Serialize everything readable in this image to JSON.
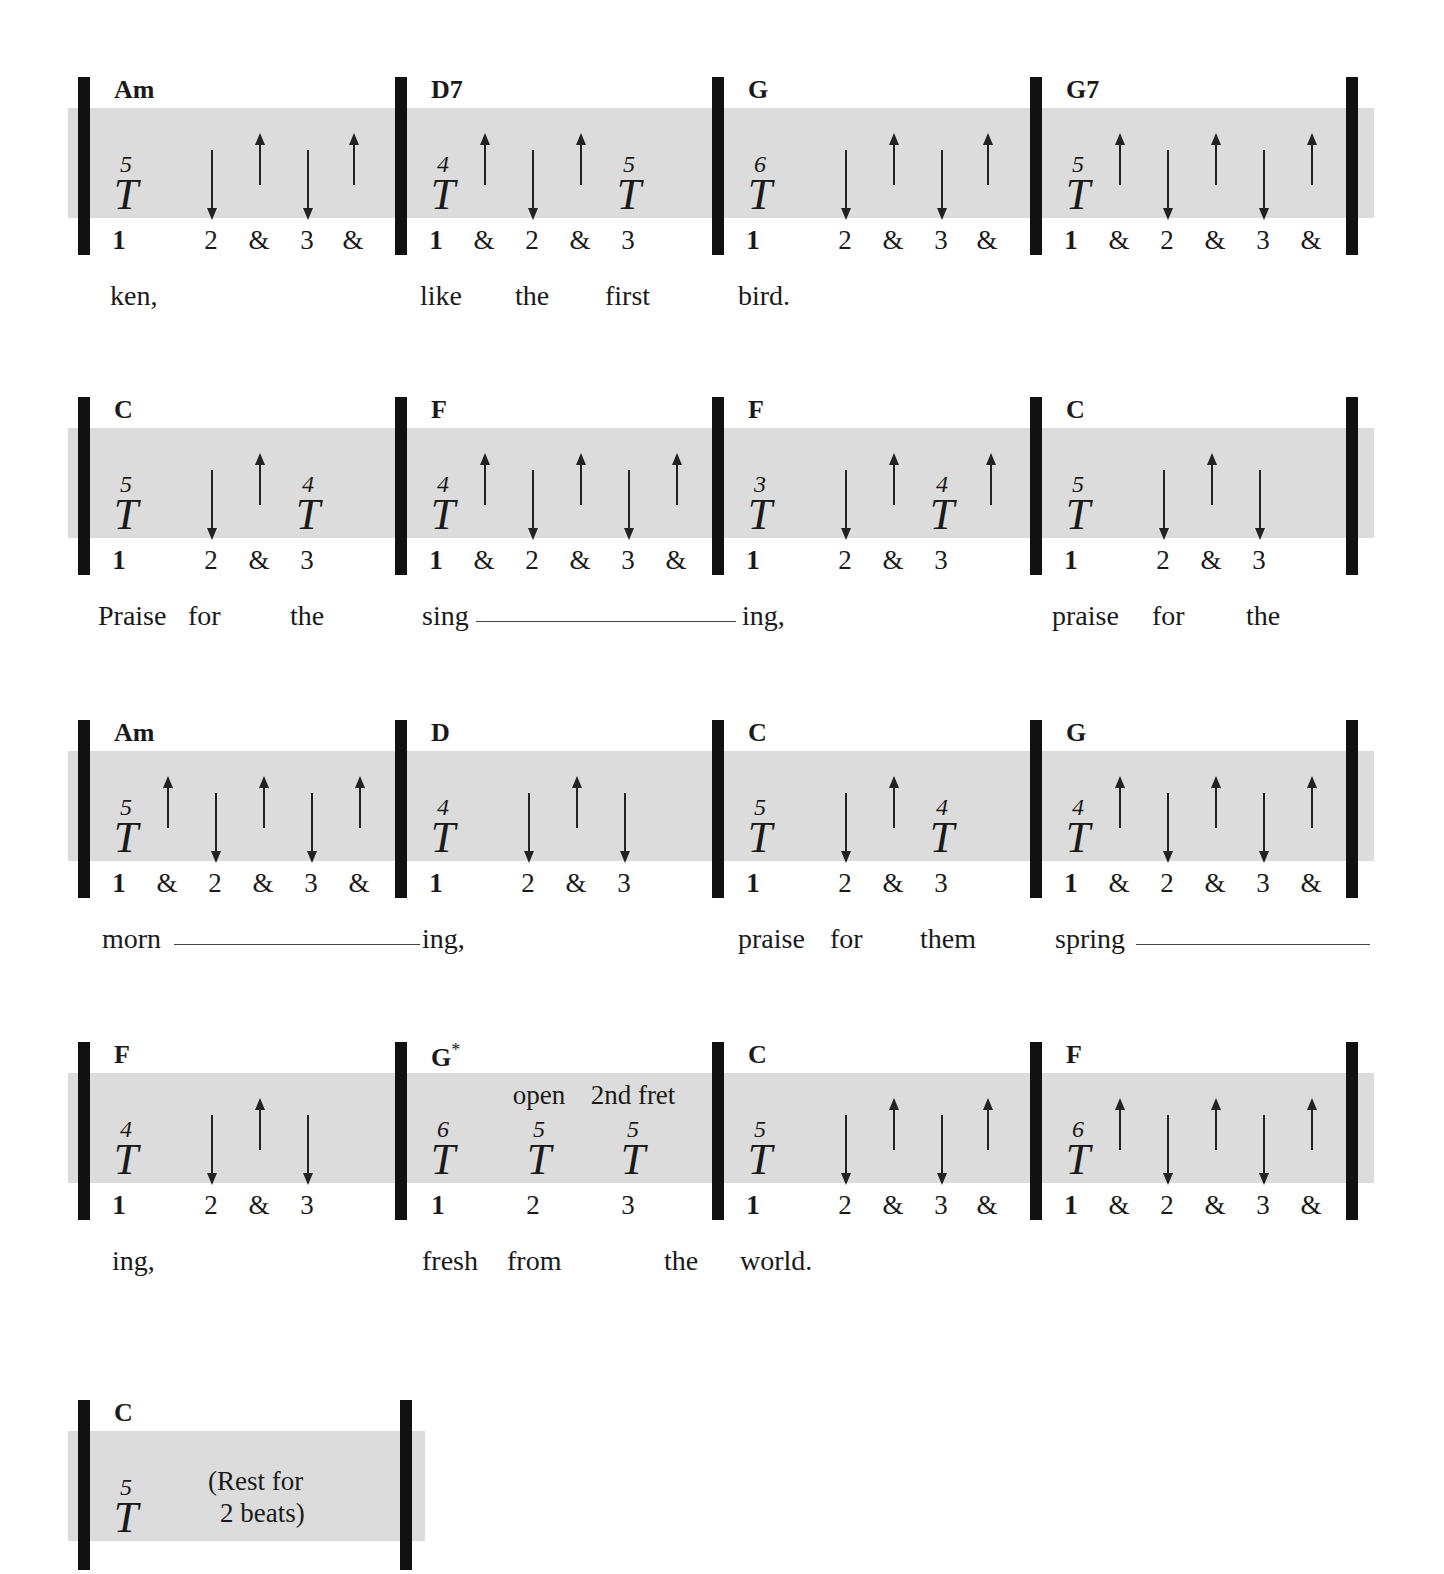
{
  "systems": [
    {
      "measures": [
        {
          "chord": "Am",
          "count": [
            "1",
            "2",
            "&",
            "3",
            "&"
          ],
          "tabs": [
            {
              "string": "5",
              "beat": "1"
            }
          ],
          "strums": [
            "down@2",
            "up@&",
            "down@3",
            "up@&"
          ]
        },
        {
          "chord": "D7",
          "count": [
            "1",
            "&",
            "2",
            "&",
            "3"
          ],
          "tabs": [
            {
              "string": "4",
              "beat": "1"
            },
            {
              "string": "5",
              "beat": "3"
            }
          ],
          "strums": [
            "up@&",
            "down@2",
            "up@&"
          ]
        },
        {
          "chord": "G",
          "count": [
            "1",
            "2",
            "&",
            "3",
            "&"
          ],
          "tabs": [
            {
              "string": "6",
              "beat": "1"
            }
          ],
          "strums": [
            "down@2",
            "up@&",
            "down@3",
            "up@&"
          ]
        },
        {
          "chord": "G7",
          "count": [
            "1",
            "&",
            "2",
            "&",
            "3",
            "&"
          ],
          "tabs": [
            {
              "string": "5",
              "beat": "1"
            }
          ],
          "strums": [
            "up@&",
            "down@2",
            "up@&",
            "down@3",
            "up@&"
          ]
        }
      ],
      "lyrics": [
        "ken,",
        "like",
        "the",
        "first",
        "bird."
      ]
    },
    {
      "measures": [
        {
          "chord": "C",
          "count": [
            "1",
            "2",
            "&",
            "3"
          ],
          "tabs": [
            {
              "string": "5",
              "beat": "1"
            },
            {
              "string": "4",
              "beat": "3"
            }
          ],
          "strums": [
            "down@2",
            "up@&"
          ]
        },
        {
          "chord": "F",
          "count": [
            "1",
            "&",
            "2",
            "&",
            "3",
            "&"
          ],
          "tabs": [
            {
              "string": "4",
              "beat": "1"
            }
          ],
          "strums": [
            "up@&",
            "down@2",
            "up@&",
            "down@3",
            "up@&"
          ]
        },
        {
          "chord": "F",
          "count": [
            "1",
            "2",
            "&",
            "3"
          ],
          "tabs": [
            {
              "string": "3",
              "beat": "1"
            },
            {
              "string": "4",
              "beat": "3"
            }
          ],
          "strums": [
            "down@2",
            "up@&",
            "up@after3"
          ]
        },
        {
          "chord": "C",
          "count": [
            "1",
            "2",
            "&",
            "3"
          ],
          "tabs": [
            {
              "string": "5",
              "beat": "1"
            }
          ],
          "strums": [
            "down@2",
            "up@&",
            "down@3"
          ]
        }
      ],
      "lyrics": [
        "Praise",
        "for",
        "the",
        "sing",
        "ing,",
        "praise",
        "for",
        "the"
      ]
    },
    {
      "measures": [
        {
          "chord": "Am",
          "count": [
            "1",
            "&",
            "2",
            "&",
            "3",
            "&"
          ],
          "tabs": [
            {
              "string": "5",
              "beat": "1"
            }
          ],
          "strums": [
            "up@&",
            "down@2",
            "up@&",
            "down@3",
            "up@&"
          ]
        },
        {
          "chord": "D",
          "count": [
            "1",
            "2",
            "&",
            "3"
          ],
          "tabs": [
            {
              "string": "4",
              "beat": "1"
            }
          ],
          "strums": [
            "down@2",
            "up@&",
            "down@3"
          ]
        },
        {
          "chord": "C",
          "count": [
            "1",
            "2",
            "&",
            "3"
          ],
          "tabs": [
            {
              "string": "5",
              "beat": "1"
            },
            {
              "string": "4",
              "beat": "3"
            }
          ],
          "strums": [
            "down@2",
            "up@&"
          ]
        },
        {
          "chord": "G",
          "count": [
            "1",
            "&",
            "2",
            "&",
            "3",
            "&"
          ],
          "tabs": [
            {
              "string": "4",
              "beat": "1"
            }
          ],
          "strums": [
            "up@&",
            "down@2",
            "up@&",
            "down@3",
            "up@&"
          ]
        }
      ],
      "lyrics": [
        "morn",
        "ing,",
        "praise",
        "for",
        "them",
        "spring"
      ]
    },
    {
      "measures": [
        {
          "chord": "F",
          "count": [
            "1",
            "2",
            "&",
            "3"
          ],
          "tabs": [
            {
              "string": "4",
              "beat": "1"
            }
          ],
          "strums": [
            "down@2",
            "up@&",
            "down@3"
          ]
        },
        {
          "chord": "G",
          "chord_mark": "*",
          "count": [
            "1",
            "2",
            "3"
          ],
          "tabs": [
            {
              "string": "6",
              "beat": "1"
            },
            {
              "string": "5",
              "beat": "2",
              "note": "open"
            },
            {
              "string": "5",
              "beat": "3",
              "note": "2nd fret"
            }
          ],
          "strums": []
        },
        {
          "chord": "C",
          "count": [
            "1",
            "2",
            "&",
            "3",
            "&"
          ],
          "tabs": [
            {
              "string": "5",
              "beat": "1"
            }
          ],
          "strums": [
            "down@2",
            "up@&",
            "down@3",
            "up@&"
          ]
        },
        {
          "chord": "F",
          "count": [
            "1",
            "&",
            "2",
            "&",
            "3",
            "&"
          ],
          "tabs": [
            {
              "string": "6",
              "beat": "1"
            }
          ],
          "strums": [
            "up@&",
            "down@2",
            "up@&",
            "down@3",
            "up@&"
          ]
        }
      ],
      "lyrics": [
        "ing,",
        "fresh",
        "from",
        "the",
        "world."
      ]
    },
    {
      "measures": [
        {
          "chord": "C",
          "count": [],
          "tabs": [
            {
              "string": "5",
              "beat": "1"
            }
          ],
          "rest_text_1": "(Rest for",
          "rest_text_2": "2 beats)"
        }
      ],
      "lyrics": []
    }
  ]
}
